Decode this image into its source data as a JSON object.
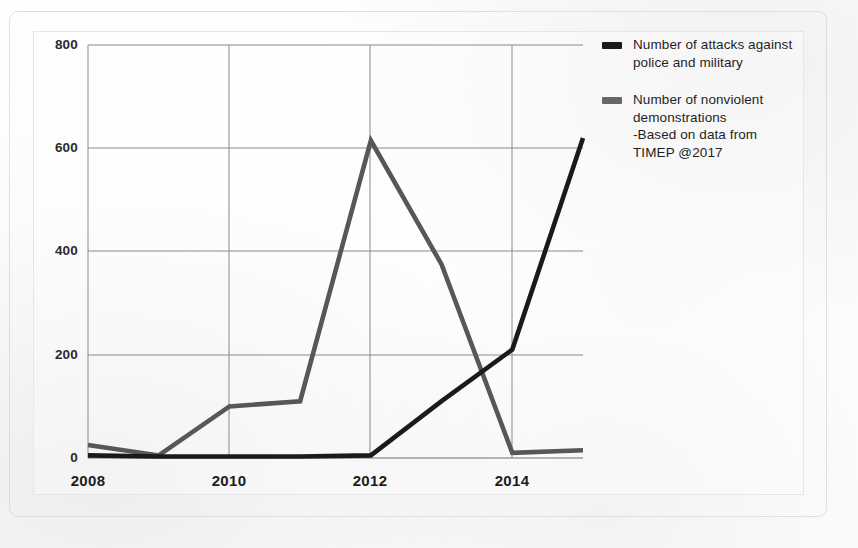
{
  "chart_data": {
    "type": "line",
    "title": "",
    "subtitle": "",
    "xlabel": "",
    "ylabel": "",
    "x": [
      2008,
      2009,
      2010,
      2011,
      2012,
      2013,
      2014,
      2015
    ],
    "xlim": [
      2008,
      2015
    ],
    "ylim": [
      0,
      800
    ],
    "xticks": [
      "2008",
      "2010",
      "2012",
      "2014"
    ],
    "xtick_values": [
      2008,
      2010,
      2012,
      2014
    ],
    "yticks": [
      "0",
      "200",
      "400",
      "600",
      "800"
    ],
    "ytick_values": [
      0,
      200,
      400,
      600,
      800
    ],
    "grid": true,
    "legend_position": "right",
    "series": [
      {
        "name": "Number of attacks against police and military",
        "color": "#1a1a1a",
        "values": [
          5,
          3,
          3,
          3,
          5,
          110,
          210,
          620
        ]
      },
      {
        "name": "Number of nonviolent demonstrations",
        "color": "#575757",
        "values": [
          25,
          5,
          100,
          110,
          615,
          375,
          10,
          15
        ]
      }
    ],
    "annotations": [
      "-Based on data from",
      "TIMEP @2017"
    ]
  },
  "legend": {
    "entries": [
      {
        "label": "Number of attacks against\npolice and military",
        "swatch_color": "#1a1a1a"
      },
      {
        "label": "Number of nonviolent\ndemonstrations\n-Based on data from\nTIMEP @2017",
        "swatch_color": "#666666"
      }
    ]
  },
  "axes": {
    "y_labels": [
      "800",
      "600",
      "400",
      "200",
      "0"
    ],
    "x_labels": [
      "2008",
      "2010",
      "2012",
      "2014"
    ]
  }
}
